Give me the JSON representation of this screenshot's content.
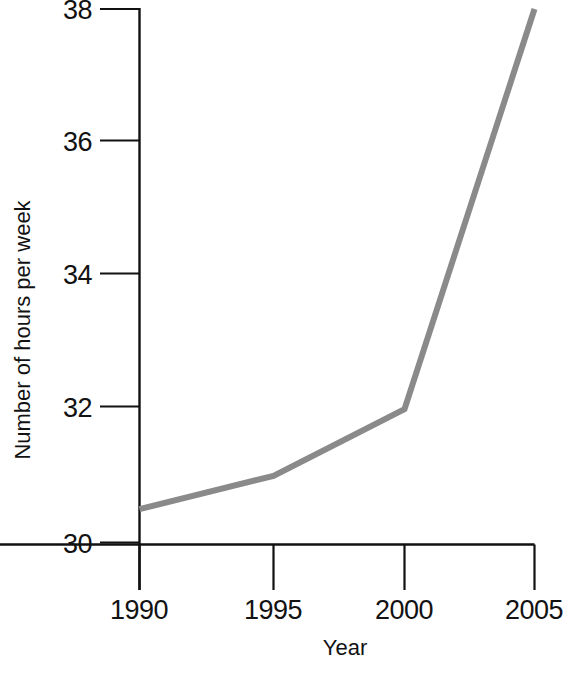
{
  "chart_data": {
    "type": "line",
    "title": "",
    "subtitle": "",
    "xlabel": "Year",
    "ylabel": "Number of hours per week",
    "x": [
      1990,
      1995,
      2000,
      2005
    ],
    "values": [
      30.5,
      31,
      32,
      38
    ],
    "xticklabels": [
      "1990",
      "1995",
      "2000",
      "2005"
    ],
    "yticklabels": [
      "30",
      "32",
      "34",
      "36",
      "38"
    ],
    "yticks": [
      30,
      32,
      34,
      36,
      38
    ],
    "xlim": [
      1990,
      2005
    ],
    "ylim": [
      30,
      38
    ],
    "grid": false,
    "legend": null,
    "legend_position": "none",
    "annotations": [],
    "series": [
      {
        "name": "Number of hours per week",
        "color": "#8a8a8a",
        "values": [
          30.5,
          31,
          32,
          38
        ]
      }
    ]
  },
  "colors": {
    "line": "#8a8a8a",
    "axis": "#111111",
    "text": "#121212",
    "background": "#ffffff"
  }
}
